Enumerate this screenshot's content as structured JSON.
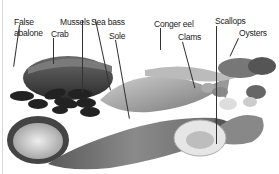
{
  "figure": {
    "labels": [
      {
        "id": "false-abalone",
        "text": "False\nabalone",
        "line1": "False",
        "line2": "abalone"
      },
      {
        "id": "crab",
        "text": "Crab"
      },
      {
        "id": "mussels",
        "text": "Mussels"
      },
      {
        "id": "sea-bass",
        "text": "Sea bass"
      },
      {
        "id": "sole",
        "text": "Sole"
      },
      {
        "id": "conger-eel",
        "text": "Conger eel"
      },
      {
        "id": "clams",
        "text": "Clams"
      },
      {
        "id": "scallops",
        "text": "Scallops"
      },
      {
        "id": "oysters",
        "text": "Oysters"
      }
    ]
  }
}
